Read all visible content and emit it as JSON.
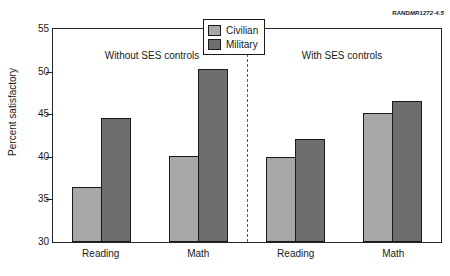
{
  "credit": {
    "brand": "RAND",
    "code": "MR1272-4.5"
  },
  "legend": {
    "position": "top-center",
    "entries": [
      {
        "label": "Civilian",
        "color": "#a8a8a8"
      },
      {
        "label": "Military",
        "color": "#6e6e6e"
      }
    ]
  },
  "panels": [
    {
      "caption": "Without SES controls"
    },
    {
      "caption": "With SES controls"
    }
  ],
  "axis": {
    "ylabel": "Percent satisfactory",
    "yticks": [
      "55",
      "50",
      "45",
      "40",
      "35",
      "30"
    ],
    "xticks": [
      "Reading",
      "Math",
      "Reading",
      "Math"
    ]
  },
  "chart_data": {
    "type": "bar",
    "title": "",
    "subtitle": "",
    "xlabel": "",
    "ylabel": "Percent satisfactory",
    "ylim": [
      30,
      55
    ],
    "ytick_step": 5,
    "grid": false,
    "legend_position": "top-center",
    "categories": [
      "Reading",
      "Math",
      "Reading",
      "Math"
    ],
    "panel_groups": [
      {
        "label": "Without SES controls",
        "categories": [
          "Reading",
          "Math"
        ]
      },
      {
        "label": "With SES controls",
        "categories": [
          "Reading",
          "Math"
        ]
      }
    ],
    "series": [
      {
        "name": "Civilian",
        "color": "#a8a8a8",
        "values": [
          36.5,
          40.1,
          40.0,
          45.2
        ]
      },
      {
        "name": "Military",
        "color": "#6e6e6e",
        "values": [
          44.6,
          50.3,
          42.1,
          46.6
        ]
      }
    ],
    "annotations": [
      "Without SES controls",
      "With SES controls",
      "RANDMR1272-4.5"
    ]
  }
}
